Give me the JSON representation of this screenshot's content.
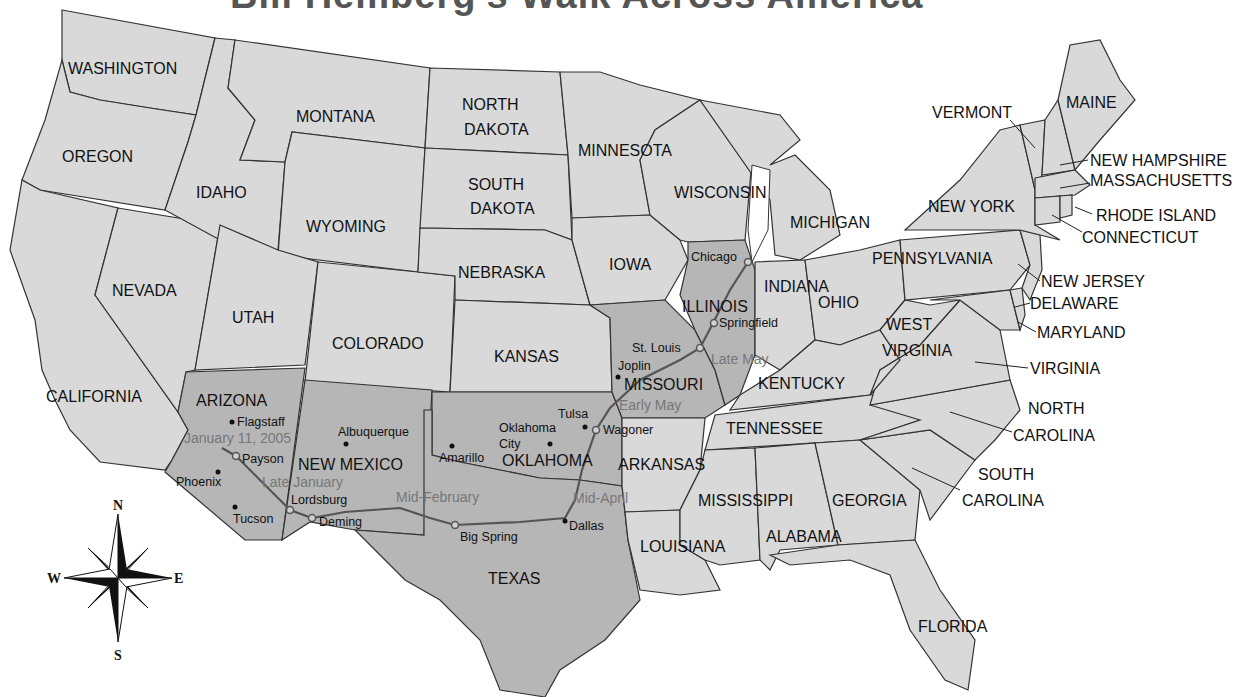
{
  "title": "Bill Hemberg's Walk Across America",
  "colors": {
    "state_fill": "#d9d9d9",
    "route_state_fill": "#b6b6b6",
    "route_line": "#555555",
    "date_label": "#777777",
    "background": "#ffffff"
  },
  "states": {
    "washington": "WASHINGTON",
    "oregon": "OREGON",
    "california": "CALIFORNIA",
    "nevada": "NEVADA",
    "idaho": "IDAHO",
    "montana": "MONTANA",
    "wyoming": "WYOMING",
    "utah": "UTAH",
    "arizona": "ARIZONA",
    "colorado": "COLORADO",
    "new_mexico": "NEW MEXICO",
    "north_dakota_1": "NORTH",
    "north_dakota_2": "DAKOTA",
    "south_dakota_1": "SOUTH",
    "south_dakota_2": "DAKOTA",
    "nebraska": "NEBRASKA",
    "kansas": "KANSAS",
    "oklahoma": "OKLAHOMA",
    "texas": "TEXAS",
    "minnesota": "MINNESOTA",
    "iowa": "IOWA",
    "missouri": "MISSOURI",
    "arkansas": "ARKANSAS",
    "louisiana": "LOUISIANA",
    "wisconsin": "WISCONSIN",
    "illinois": "ILLINOIS",
    "michigan": "MICHIGAN",
    "indiana": "INDIANA",
    "ohio": "OHIO",
    "kentucky": "KENTUCKY",
    "tennessee": "TENNESSEE",
    "mississippi": "MISSISSIPPI",
    "alabama": "ALABAMA",
    "georgia": "GEORGIA",
    "florida": "FLORIDA",
    "south_carolina_1": "SOUTH",
    "south_carolina_2": "CAROLINA",
    "north_carolina_1": "NORTH",
    "north_carolina_2": "CAROLINA",
    "virginia": "VIRGINIA",
    "west_virginia_1": "WEST",
    "west_virginia_2": "VIRGINIA",
    "pennsylvania": "PENNSYLVANIA",
    "new_york": "NEW YORK",
    "vermont": "VERMONT",
    "maine": "MAINE",
    "new_hampshire": "NEW HAMPSHIRE",
    "massachusetts": "MASSACHUSETTS",
    "rhode_island": "RHODE ISLAND",
    "connecticut": "CONNECTICUT",
    "new_jersey": "NEW JERSEY",
    "delaware": "DELAWARE",
    "maryland": "MARYLAND"
  },
  "cities": {
    "flagstaff": "Flagstaff",
    "payson": "Payson",
    "phoenix": "Phoenix",
    "tucson": "Tucson",
    "lordsburg": "Lordsburg",
    "deming": "Deming",
    "albuquerque": "Albuquerque",
    "amarillo": "Amarillo",
    "big_spring": "Big Spring",
    "dallas": "Dallas",
    "oklahoma_city_1": "Oklahoma",
    "oklahoma_city_2": "City",
    "tulsa": "Tulsa",
    "wagoner": "Wagoner",
    "joplin": "Joplin",
    "st_louis": "St. Louis",
    "springfield": "Springfield",
    "chicago": "Chicago"
  },
  "route_dates": {
    "start": "January 11, 2005",
    "late_january": "Late January",
    "mid_february": "Mid-February",
    "mid_april": "Mid-April",
    "early_may": "Early May",
    "late_may": "Late May"
  },
  "compass": {
    "north": "N",
    "south": "S",
    "east": "E",
    "west": "W"
  }
}
